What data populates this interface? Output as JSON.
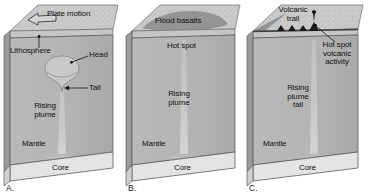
{
  "figure": {
    "type": "diagram",
    "panel_count": 3
  },
  "colors": {
    "page_background": "#ffffff",
    "mantle": "#b6b6b6",
    "mantle_shadow": "#a6a6a6",
    "core": "#e2e2e2",
    "lithosphere": "#c2c2c2",
    "top_surface": "#cfcfcf",
    "top_surface_speckle": "#b0b0b0",
    "flood_basalt": "#8e8e8e",
    "plume": "#cdcdcd",
    "side_face": "#9c9c9c",
    "outline": "#4a4a4a",
    "text": "#101010",
    "volcano": "#1a1a1a"
  },
  "panels": [
    {
      "letter": "A.",
      "letter_name": "panel-label-a",
      "stage": "plume head rising beneath plate",
      "labels": [
        {
          "name": "plate-motion-label",
          "text": "Plate motion",
          "lines": [
            "Plate motion"
          ]
        },
        {
          "name": "lithosphere-label",
          "text": "Lithosphere",
          "lines": [
            "Lithosphere"
          ]
        },
        {
          "name": "head-label",
          "text": "Head",
          "lines": [
            "Head"
          ]
        },
        {
          "name": "tail-label",
          "text": "Tail",
          "lines": [
            "Tail"
          ]
        },
        {
          "name": "rising-plume-label",
          "text": "Rising plume",
          "lines": [
            "Rising",
            "plume"
          ]
        },
        {
          "name": "mantle-label",
          "text": "Mantle",
          "lines": [
            "Mantle"
          ]
        },
        {
          "name": "core-label",
          "text": "Core",
          "lines": [
            "Core"
          ]
        }
      ],
      "features": {
        "plate_motion_arrow": "open outlined arrow pointing left on top surface",
        "plume_head_shape": "mushroom / anvil head with down-curled rim",
        "plume_tail": "narrow vertical column from core to head"
      }
    },
    {
      "letter": "B.",
      "letter_name": "panel-label-b",
      "stage": "plume head reaches surface producing flood basalts",
      "labels": [
        {
          "name": "flood-basalts-label",
          "text": "Flood basalts",
          "lines": [
            "Flood basalts"
          ]
        },
        {
          "name": "hot-spot-label",
          "text": "Hot spot",
          "lines": [
            "Hot spot"
          ]
        },
        {
          "name": "rising-plume-label",
          "text": "Rising plume",
          "lines": [
            "Rising",
            "plume"
          ]
        },
        {
          "name": "mantle-label",
          "text": "Mantle",
          "lines": [
            "Mantle"
          ]
        },
        {
          "name": "core-label",
          "text": "Core",
          "lines": [
            "Core"
          ]
        }
      ],
      "features": {
        "flood_basalt_patch": "dark gray lava field on top surface",
        "plume_tail": "narrow vertical column from core to lithosphere"
      }
    },
    {
      "letter": "C.",
      "letter_name": "panel-label-c",
      "stage": "plate migration builds a volcanic trail over the hot spot",
      "labels": [
        {
          "name": "volcanic-trail-label",
          "text": "Volcanic trail",
          "lines": [
            "Volcanic",
            "trail"
          ]
        },
        {
          "name": "hot-spot-activity-label",
          "text": "Hot spot volcanic activity",
          "lines": [
            "Hot spot",
            "volcanic",
            "activity"
          ]
        },
        {
          "name": "rising-plume-tail-label",
          "text": "Rising plume tail",
          "lines": [
            "Rising",
            "plume",
            "tail"
          ]
        },
        {
          "name": "mantle-label",
          "text": "Mantle",
          "lines": [
            "Mantle"
          ]
        },
        {
          "name": "core-label",
          "text": "Core",
          "lines": [
            "Core"
          ]
        }
      ],
      "features": {
        "volcano_count": 4,
        "volcanic_trail": "row of small black cones, tallest active one at right end",
        "plume_tail": "narrow vertical column from core to active volcano"
      }
    }
  ]
}
